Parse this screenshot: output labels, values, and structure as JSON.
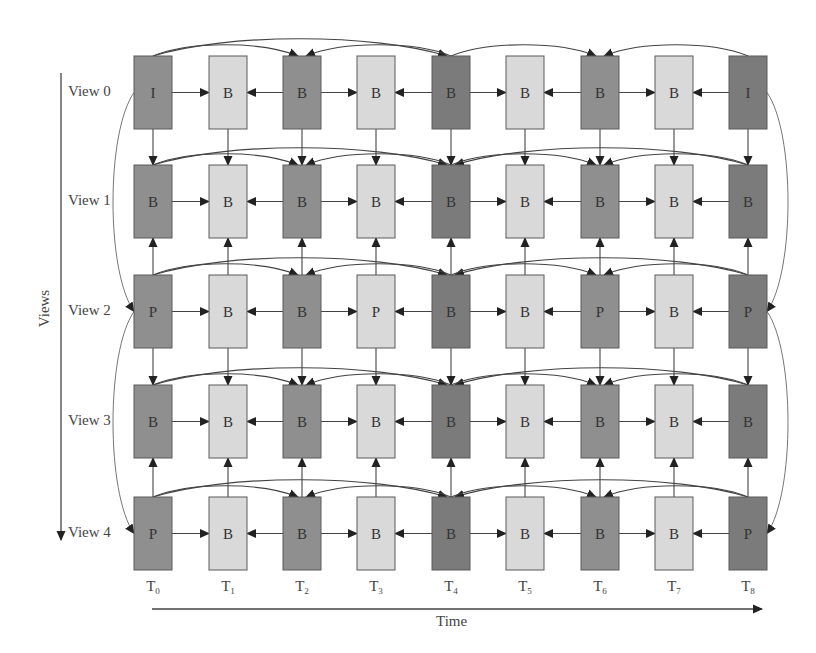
{
  "colors": {
    "dark": "#7b7b7b",
    "medium": "#8f8f8f",
    "light": "#d9d9d9",
    "stroke": "#5a5a5a",
    "arrow": "#222222",
    "text": "#333333"
  },
  "axes": {
    "views_title": "Views",
    "time_title": "Time"
  },
  "views": [
    "View 0",
    "View 1",
    "View 2",
    "View 3",
    "View 4"
  ],
  "times": [
    {
      "base": "T",
      "sub": "0"
    },
    {
      "base": "T",
      "sub": "1"
    },
    {
      "base": "T",
      "sub": "2"
    },
    {
      "base": "T",
      "sub": "3"
    },
    {
      "base": "T",
      "sub": "4"
    },
    {
      "base": "T",
      "sub": "5"
    },
    {
      "base": "T",
      "sub": "6"
    },
    {
      "base": "T",
      "sub": "7"
    },
    {
      "base": "T",
      "sub": "8"
    }
  ],
  "frames": [
    [
      "I",
      "B",
      "B",
      "B",
      "B",
      "B",
      "B",
      "B",
      "I"
    ],
    [
      "B",
      "B",
      "B",
      "B",
      "B",
      "B",
      "B",
      "B",
      "B"
    ],
    [
      "P",
      "B",
      "B",
      "P",
      "B",
      "B",
      "P",
      "B",
      "P"
    ],
    [
      "B",
      "B",
      "B",
      "B",
      "B",
      "B",
      "B",
      "B",
      "B"
    ],
    [
      "P",
      "B",
      "B",
      "B",
      "B",
      "B",
      "B",
      "B",
      "P"
    ]
  ],
  "shades": [
    "medium",
    "light",
    "medium",
    "light",
    "dark",
    "light",
    "medium",
    "light",
    "dark"
  ],
  "layout": {
    "col_x": [
      134,
      209,
      283,
      357,
      432,
      506,
      581,
      655,
      729
    ],
    "row_y": [
      56,
      165,
      275,
      385,
      497
    ],
    "box_w": 38,
    "box_h": 73
  },
  "vertical_refs": [
    {
      "from_view": 0,
      "to_view": 1
    },
    {
      "from_view": 2,
      "to_view": 1
    },
    {
      "from_view": 2,
      "to_view": 3
    },
    {
      "from_view": 4,
      "to_view": 3
    }
  ],
  "interview_curves": [
    {
      "from_view": 0,
      "to_view": 2,
      "side": "left",
      "col": 0
    },
    {
      "from_view": 2,
      "to_view": 4,
      "side": "left",
      "col": 0
    },
    {
      "from_view": 0,
      "to_view": 2,
      "side": "right",
      "col": 8
    },
    {
      "from_view": 2,
      "to_view": 4,
      "side": "right",
      "col": 8
    }
  ],
  "temporal_arcs": {
    "row0": [
      [
        0,
        4
      ],
      [
        0,
        2
      ],
      [
        4,
        2
      ],
      [
        4,
        6
      ],
      [
        8,
        6
      ]
    ],
    "others": [
      [
        0,
        4
      ],
      [
        8,
        4
      ],
      [
        0,
        2
      ],
      [
        4,
        2
      ],
      [
        4,
        6
      ],
      [
        8,
        6
      ]
    ]
  },
  "horizontal_refs": [
    [
      0,
      1
    ],
    [
      2,
      1
    ],
    [
      2,
      3
    ],
    [
      4,
      3
    ],
    [
      4,
      5
    ],
    [
      6,
      5
    ],
    [
      6,
      7
    ],
    [
      8,
      7
    ]
  ]
}
